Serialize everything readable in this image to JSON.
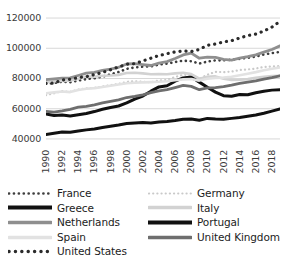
{
  "chart_data": {
    "type": "line",
    "title": "",
    "xlabel": "",
    "ylabel": "",
    "grid": true,
    "legend_position": "bottom",
    "x": [
      1990,
      1991,
      1992,
      1993,
      1994,
      1995,
      1996,
      1997,
      1998,
      1999,
      2000,
      2001,
      2002,
      2003,
      2004,
      2005,
      2006,
      2007,
      2008,
      2009,
      2010,
      2011,
      2012,
      2013,
      2014,
      2015,
      2016,
      2017,
      2018,
      2019
    ],
    "xticks": [
      "1990",
      "1992",
      "1994",
      "1996",
      "1998",
      "2000",
      "2002",
      "2004",
      "2006",
      "2008",
      "2010",
      "2012",
      "2014",
      "2016",
      "2018"
    ],
    "yticks": [
      "40000",
      "60000",
      "80000",
      "100000",
      "120000"
    ],
    "ylim": [
      34000,
      124000
    ],
    "xlim": [
      1990,
      2019
    ],
    "series": [
      {
        "name": "France",
        "style": "dotted",
        "color": "#3d3d3d",
        "width": 2.6,
        "values": [
          76500,
          77000,
          77800,
          77500,
          78600,
          79600,
          80100,
          81200,
          82800,
          84300,
          86400,
          87300,
          87800,
          88000,
          89200,
          89800,
          90900,
          91800,
          91400,
          89900,
          91200,
          92000,
          92000,
          92400,
          93000,
          93700,
          94500,
          95900,
          96800,
          97600
        ]
      },
      {
        "name": "Germany",
        "style": "dotted",
        "color": "#c9c9c9",
        "width": 2.2,
        "values": [
          69000,
          70200,
          71600,
          71200,
          72700,
          73400,
          73800,
          74700,
          75600,
          76400,
          77800,
          78200,
          77900,
          77500,
          78700,
          79100,
          81000,
          82400,
          82600,
          79700,
          82500,
          84400,
          84200,
          84600,
          85600,
          86000,
          86600,
          87600,
          88000,
          88200
        ]
      },
      {
        "name": "Greece",
        "style": "solid",
        "color": "#111111",
        "width": 3.0,
        "values": [
          56500,
          55500,
          55800,
          55200,
          56000,
          56800,
          58100,
          59600,
          60800,
          61800,
          63800,
          66400,
          68400,
          71600,
          74400,
          75200,
          78200,
          80400,
          81000,
          77600,
          74200,
          71000,
          68600,
          68200,
          69400,
          69200,
          70600,
          71600,
          72300,
          72600
        ]
      },
      {
        "name": "Italy",
        "style": "solid",
        "color": "#d2d2d2",
        "width": 2.6,
        "values": [
          77500,
          78200,
          78400,
          78600,
          79800,
          81400,
          81200,
          81800,
          82000,
          82400,
          83600,
          83800,
          83400,
          82800,
          82900,
          82800,
          83400,
          83800,
          82900,
          79900,
          81200,
          81400,
          79800,
          79000,
          79200,
          79600,
          80400,
          81200,
          81600,
          81800
        ]
      },
      {
        "name": "Netherlands",
        "style": "solid",
        "color": "#8f8f8f",
        "width": 2.8,
        "values": [
          79200,
          79800,
          80200,
          80400,
          82000,
          83600,
          84000,
          85400,
          86200,
          87400,
          89600,
          89800,
          89200,
          88600,
          90200,
          91200,
          93200,
          95600,
          96800,
          93400,
          94200,
          94000,
          92600,
          92200,
          93400,
          94400,
          95600,
          97400,
          99200,
          101600
        ]
      },
      {
        "name": "Portugal",
        "style": "solid",
        "color": "#111111",
        "width": 3.0,
        "values": [
          43000,
          43800,
          44600,
          44400,
          45200,
          46000,
          46600,
          47600,
          48400,
          49200,
          50200,
          50600,
          50800,
          50600,
          51200,
          51600,
          52200,
          53000,
          53200,
          52400,
          53600,
          53200,
          53000,
          53600,
          54200,
          55000,
          55800,
          57000,
          58400,
          59800
        ]
      },
      {
        "name": "Spain",
        "style": "solid",
        "color": "#e2e2e2",
        "width": 2.6,
        "values": [
          70200,
          70800,
          71400,
          71000,
          72400,
          73200,
          73600,
          74400,
          75200,
          76000,
          76800,
          77200,
          77400,
          77600,
          77800,
          78200,
          78800,
          79400,
          79600,
          78600,
          79800,
          80400,
          80600,
          81200,
          82200,
          83200,
          84200,
          85400,
          86400,
          87400
        ]
      },
      {
        "name": "United Kingdom",
        "style": "solid",
        "color": "#6e6e6e",
        "width": 2.8,
        "values": [
          58200,
          57800,
          58600,
          59600,
          61000,
          61600,
          62600,
          63800,
          64800,
          65800,
          67400,
          68200,
          69200,
          70600,
          71800,
          72600,
          74000,
          75400,
          74800,
          72600,
          73800,
          74000,
          74600,
          75600,
          76800,
          77600,
          78400,
          79600,
          80600,
          81800
        ]
      },
      {
        "name": "United States",
        "style": "dotted",
        "color": "#2b2b2b",
        "width": 3.2,
        "values": [
          76800,
          77000,
          79000,
          79400,
          80600,
          81200,
          82600,
          84000,
          85800,
          87600,
          89400,
          89800,
          91600,
          93400,
          95200,
          96400,
          97600,
          98200,
          97800,
          99200,
          102000,
          102800,
          104200,
          105000,
          106800,
          108400,
          109400,
          111400,
          114000,
          117800
        ]
      }
    ]
  },
  "legend": {
    "items": [
      {
        "name": "France",
        "style": "dotted",
        "color": "#3d3d3d",
        "width": 2.6
      },
      {
        "name": "Germany",
        "style": "dotted",
        "color": "#c9c9c9",
        "width": 2.2
      },
      {
        "name": "Greece",
        "style": "solid",
        "color": "#111111",
        "width": 4.2
      },
      {
        "name": "Italy",
        "style": "solid",
        "color": "#d2d2d2",
        "width": 3.4
      },
      {
        "name": "Netherlands",
        "style": "solid",
        "color": "#8f8f8f",
        "width": 3.6
      },
      {
        "name": "Portugal",
        "style": "solid",
        "color": "#111111",
        "width": 4.2
      },
      {
        "name": "Spain",
        "style": "solid",
        "color": "#e2e2e2",
        "width": 3.4
      },
      {
        "name": "United Kingdom",
        "style": "solid",
        "color": "#6e6e6e",
        "width": 3.6
      },
      {
        "name": "United States",
        "style": "dotted",
        "color": "#2b2b2b",
        "width": 3.4
      }
    ]
  }
}
